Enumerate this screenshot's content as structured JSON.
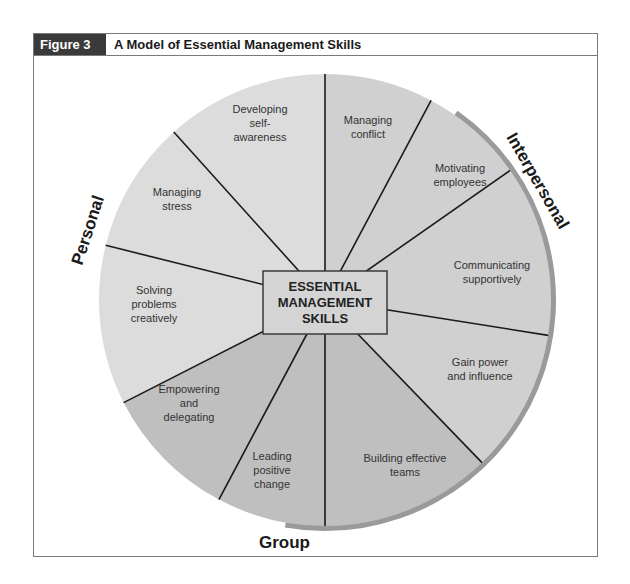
{
  "figure": {
    "label": "Figure 3",
    "title": "A Model of Essential Management Skills"
  },
  "center": {
    "lines": [
      "ESSENTIAL",
      "MANAGEMENT",
      "SKILLS"
    ]
  },
  "categories": {
    "personal": {
      "label": "Personal",
      "color": "#dcdcdc"
    },
    "interpersonal": {
      "label": "Interpersonal",
      "color": "#d0d0d0"
    },
    "group": {
      "label": "Group",
      "color": "#bfbfbf"
    }
  },
  "segments": [
    {
      "category": "interpersonal",
      "lines": [
        "Managing",
        "conflict"
      ]
    },
    {
      "category": "interpersonal",
      "lines": [
        "Motivating",
        "employees"
      ]
    },
    {
      "category": "interpersonal",
      "lines": [
        "Communicating",
        "supportively"
      ]
    },
    {
      "category": "interpersonal",
      "lines": [
        "Gain power",
        "and influence"
      ]
    },
    {
      "category": "group",
      "lines": [
        "Building effective",
        "teams"
      ]
    },
    {
      "category": "group",
      "lines": [
        "Leading",
        "positive",
        "change"
      ]
    },
    {
      "category": "group",
      "lines": [
        "Empowering",
        "and",
        "delegating"
      ]
    },
    {
      "category": "personal",
      "lines": [
        "Solving",
        "problems",
        "creatively"
      ]
    },
    {
      "category": "personal",
      "lines": [
        "Managing",
        "stress"
      ]
    },
    {
      "category": "personal",
      "lines": [
        "Developing",
        "self-",
        "awareness"
      ]
    }
  ],
  "rim_color": "#9a9a9a"
}
